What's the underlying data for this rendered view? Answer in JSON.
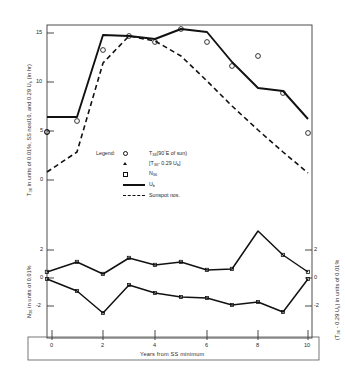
{
  "figure": {
    "xlabel": "Years from SS minimum",
    "ylabel_left_top": "T36 in units of 0.01%, SS nos/10, and 0.29 Ub (in hr)",
    "ylabel_left_bottom": "N36 in units of 0.01%",
    "ylabel_right_bottom": "(T36 - 0.29 Ub) in units of 0.01%"
  },
  "legend": {
    "title": "Legend:",
    "items": [
      {
        "marker": "circle-marker",
        "label": "T36(90°E of sun)"
      },
      {
        "marker": "triangle-marker",
        "label": "[T36 - 0.29 Ub]"
      },
      {
        "marker": "square-marker",
        "label": "N36"
      },
      {
        "marker": "solid-line",
        "label": "Ub"
      },
      {
        "marker": "dashed-line",
        "label": "Sunspot nos."
      }
    ]
  },
  "axes": {
    "x_ticks": [
      "0",
      "2",
      "4",
      "6",
      "8",
      "10"
    ],
    "y_ticks_top": [
      "15",
      "10",
      "5",
      "0"
    ],
    "y_ticks_bottom_left": [
      "2",
      "0",
      "-2"
    ],
    "y_ticks_bottom_right": [
      "2",
      "0",
      "-2"
    ]
  },
  "colors": {
    "ink": "#111111",
    "background": "#ffffff",
    "axis": "#333333"
  },
  "chart_data": {
    "type": "line",
    "title": "",
    "xlabel": "Years from SS minimum",
    "ylabel": "T36 in units of 0.01%, SS nos/10, and 0.29 Ub (in hr)",
    "y2label": "(T36 - 0.29 Ub) in units of 0.01%",
    "grid": false,
    "legend_position": "center-left",
    "x": [
      0,
      1,
      2,
      3,
      4,
      5,
      6,
      7,
      8,
      9,
      10
    ],
    "panels": [
      {
        "name": "upper-panel",
        "ylim": [
          0,
          17
        ],
        "ytick_values": [
          0,
          5,
          10,
          15
        ],
        "series": [
          {
            "name": "Ub",
            "style": "solid-line",
            "values": [
              6.4,
              6.4,
              15.5,
              15.4,
              15.1,
              15.9,
              15.6,
              12.6,
              9.6,
              9.3,
              6.3
            ]
          },
          {
            "name": "Sunspot nos.",
            "style": "dashed-line",
            "values": [
              0.9,
              3.0,
              11.9,
              15.3,
              14.8,
              13.1,
              10.6,
              8.0,
              5.6,
              3.4,
              0.8
            ]
          },
          {
            "name": "T36(90°E of sun)",
            "style": "circle-markers",
            "values": [
              4.9,
              5.9,
              13.9,
              15.3,
              14.7,
              15.9,
              14.7,
              12.3,
              13.3,
              9.5,
              4.8
            ]
          }
        ]
      },
      {
        "name": "lower-panel",
        "ylim": [
          -3.2,
          3.2
        ],
        "ytick_values": [
          -2,
          0,
          2
        ],
        "series": [
          {
            "name": "T36 - 0.29 Ub",
            "style": "triangle-markers-line",
            "axis": "right",
            "values": [
              -1.6,
              -0.1,
              -1.8,
              0.3,
              -0.3,
              0.0,
              -0.8,
              -0.7,
              2.7,
              0.4,
              -1.6
            ]
          },
          {
            "name": "N36",
            "style": "square-markers-line",
            "axis": "left",
            "values": [
              1.9,
              0.5,
              -1.8,
              1.3,
              0.6,
              0.1,
              0.0,
              -0.9,
              -0.5,
              -1.7,
              1.9
            ]
          }
        ]
      }
    ]
  }
}
